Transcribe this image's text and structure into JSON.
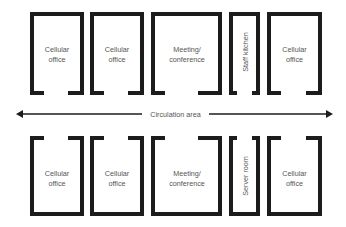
{
  "colors": {
    "wall": "#1c1c1c",
    "text": "#555555",
    "background": "#ffffff"
  },
  "circulation": {
    "label": "Circulation area",
    "arrow": "double-headed horizontal"
  },
  "top_row": [
    {
      "label_line1": "Cellular",
      "label_line2": "office"
    },
    {
      "label_line1": "Cellular",
      "label_line2": "office"
    },
    {
      "label_line1": "Meeting/",
      "label_line2": "conference"
    },
    {
      "label_vertical": "Staff kitchen"
    },
    {
      "label_line1": "Cellular",
      "label_line2": "office"
    }
  ],
  "bottom_row": [
    {
      "label_line1": "Cellular",
      "label_line2": "office"
    },
    {
      "label_line1": "Cellular",
      "label_line2": "office"
    },
    {
      "label_line1": "Meeting/",
      "label_line2": "conference"
    },
    {
      "label_vertical": "Server room"
    },
    {
      "label_line1": "Cellular",
      "label_line2": "office"
    }
  ]
}
